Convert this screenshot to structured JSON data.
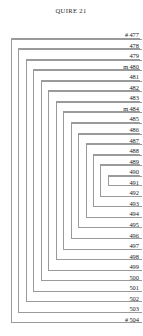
{
  "diagram": {
    "title": "QUIRE 21",
    "type": "quire-collation-diagram",
    "quire_number": 21,
    "leaf_count": 28,
    "bifolia_count": 14,
    "first_folio": "477",
    "last_folio": "504",
    "ink_color": "#9a9a9a",
    "text_color": "#1a1a1a",
    "background_color": "#ffffff",
    "leaves": [
      {
        "mark": "#",
        "folio": "477",
        "bifolium": 1,
        "side": "first"
      },
      {
        "mark": "",
        "folio": "478",
        "bifolium": 2,
        "side": "first"
      },
      {
        "mark": "",
        "folio": "479",
        "bifolium": 3,
        "side": "first"
      },
      {
        "mark": "m",
        "folio": "480",
        "bifolium": 4,
        "side": "first"
      },
      {
        "mark": "",
        "folio": "481",
        "bifolium": 5,
        "side": "first"
      },
      {
        "mark": "",
        "folio": "482",
        "bifolium": 6,
        "side": "first"
      },
      {
        "mark": "",
        "folio": "483",
        "bifolium": 7,
        "side": "first"
      },
      {
        "mark": "m",
        "folio": "484",
        "bifolium": 8,
        "side": "first"
      },
      {
        "mark": "",
        "folio": "485",
        "bifolium": 9,
        "side": "first"
      },
      {
        "mark": "",
        "folio": "486",
        "bifolium": 10,
        "side": "first"
      },
      {
        "mark": "",
        "folio": "487",
        "bifolium": 11,
        "side": "first"
      },
      {
        "mark": "",
        "folio": "488",
        "bifolium": 12,
        "side": "first"
      },
      {
        "mark": "",
        "folio": "489",
        "bifolium": 13,
        "side": "first"
      },
      {
        "mark": "",
        "folio": "490",
        "bifolium": 14,
        "side": "first"
      },
      {
        "mark": "",
        "folio": "491",
        "bifolium": 14,
        "side": "second"
      },
      {
        "mark": "",
        "folio": "492",
        "bifolium": 13,
        "side": "second"
      },
      {
        "mark": "",
        "folio": "493",
        "bifolium": 12,
        "side": "second"
      },
      {
        "mark": "",
        "folio": "494",
        "bifolium": 11,
        "side": "second"
      },
      {
        "mark": "",
        "folio": "495",
        "bifolium": 10,
        "side": "second"
      },
      {
        "mark": "",
        "folio": "496",
        "bifolium": 9,
        "side": "second"
      },
      {
        "mark": "",
        "folio": "497",
        "bifolium": 8,
        "side": "second"
      },
      {
        "mark": "",
        "folio": "498",
        "bifolium": 7,
        "side": "second"
      },
      {
        "mark": "",
        "folio": "499",
        "bifolium": 6,
        "side": "second"
      },
      {
        "mark": "",
        "folio": "500",
        "bifolium": 5,
        "side": "second"
      },
      {
        "mark": "",
        "folio": "501",
        "bifolium": 4,
        "side": "second"
      },
      {
        "mark": "",
        "folio": "502",
        "bifolium": 3,
        "side": "second"
      },
      {
        "mark": "",
        "folio": "503",
        "bifolium": 2,
        "side": "second"
      },
      {
        "mark": "#",
        "folio": "504",
        "bifolium": 1,
        "side": "second"
      }
    ]
  },
  "layout": {
    "first_row_top": 28.0,
    "row_height": 10.55,
    "outer_bracket_left": 11.0,
    "bracket_step": 7.45,
    "label_column_right": 142
  }
}
